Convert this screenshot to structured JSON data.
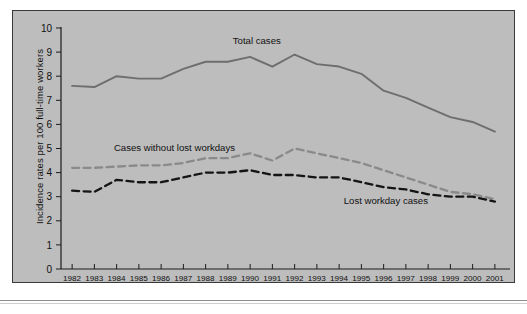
{
  "figure": {
    "background_color": "#ffffff",
    "panel_background_color": "#bdbdbd",
    "panel_border_color": "#3a3a3a"
  },
  "chart_data": {
    "type": "line",
    "title": "",
    "xlabel": "",
    "ylabel": "Incidence rates per 100 full-time workers",
    "ylim": [
      0,
      10
    ],
    "ytick_labels": [
      "0",
      "1",
      "2",
      "3",
      "4",
      "5",
      "6",
      "7",
      "8",
      "9",
      "10"
    ],
    "yticks": [
      0,
      1,
      2,
      3,
      4,
      5,
      6,
      7,
      8,
      9,
      10
    ],
    "grid": false,
    "legend_position": "inline-annotations",
    "categories": [
      "1982",
      "1983",
      "1984",
      "1985",
      "1986",
      "1987",
      "1988",
      "1989",
      "1990",
      "1991",
      "1992",
      "1993",
      "1994",
      "1995",
      "1996",
      "1997",
      "1998",
      "1999",
      "2000",
      "2001"
    ],
    "x": [
      1982,
      1983,
      1984,
      1985,
      1986,
      1987,
      1988,
      1989,
      1990,
      1991,
      1992,
      1993,
      1994,
      1995,
      1996,
      1997,
      1998,
      1999,
      2000,
      2001
    ],
    "series": [
      {
        "name": "Total cases",
        "color": "#6e6e6e",
        "style": "solid",
        "label_text": "Total cases",
        "values": [
          7.6,
          7.55,
          8.0,
          7.9,
          7.9,
          8.3,
          8.6,
          8.6,
          8.8,
          8.4,
          8.9,
          8.5,
          8.4,
          8.1,
          7.4,
          7.1,
          6.7,
          6.3,
          6.1,
          5.7
        ]
      },
      {
        "name": "Cases without lost workdays",
        "color": "#8a8a8a",
        "style": "dashed",
        "label_text": "Cases without lost workdays",
        "values": [
          4.2,
          4.2,
          4.25,
          4.3,
          4.3,
          4.4,
          4.6,
          4.6,
          4.8,
          4.5,
          5.0,
          4.8,
          4.6,
          4.4,
          4.1,
          3.8,
          3.5,
          3.2,
          3.1,
          2.9
        ]
      },
      {
        "name": "Lost workday cases",
        "color": "#141414",
        "style": "dashed",
        "label_text": "Lost workday cases",
        "values": [
          3.25,
          3.2,
          3.7,
          3.6,
          3.6,
          3.8,
          4.0,
          4.0,
          4.1,
          3.9,
          3.9,
          3.8,
          3.8,
          3.6,
          3.4,
          3.3,
          3.1,
          3.0,
          3.0,
          2.8
        ]
      }
    ],
    "annotations": [
      {
        "text": "Total cases",
        "series": "Total cases"
      },
      {
        "text": "Cases without lost workdays",
        "series": "Cases without lost workdays"
      },
      {
        "text": "Lost workday cases",
        "series": "Lost workday cases"
      }
    ]
  }
}
